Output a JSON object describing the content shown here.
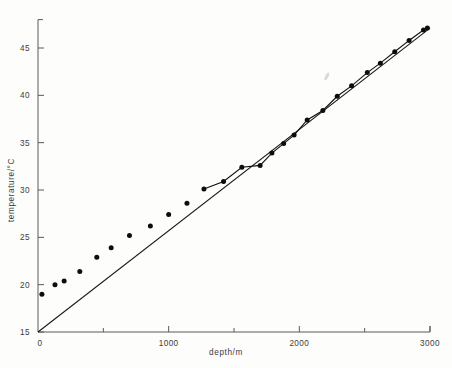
{
  "figure": {
    "name": "temperature-depth-plot",
    "background_color": "#fdfdfc",
    "ink_color": "#111111",
    "axis_color": "#5a5a5a"
  },
  "chart_data": {
    "type": "scatter",
    "title": "",
    "subtitle": "",
    "xlabel": "depth/m",
    "ylabel": "temperature/°C",
    "xlim": [
      0,
      3000
    ],
    "ylim": [
      15,
      48
    ],
    "grid": false,
    "legend_position": "none",
    "xtick_labels": [
      "0",
      "1000",
      "2000",
      "3000"
    ],
    "xtick_values": [
      0,
      1000,
      2000,
      3000
    ],
    "xminor_tick_values": [
      500,
      1500,
      2500
    ],
    "ytick_labels": [
      "15",
      "20",
      "25",
      "30",
      "35",
      "40",
      "45"
    ],
    "ytick_values": [
      15,
      20,
      25,
      30,
      35,
      40,
      45
    ],
    "origin_label": "0",
    "series": [
      {
        "name": "measured temperature",
        "marker": "filled-circle",
        "connected_from_x": 1270,
        "x": [
          30,
          130,
          200,
          320,
          450,
          560,
          700,
          860,
          1000,
          1140,
          1270,
          1420,
          1560,
          1700,
          1790,
          1880,
          1960,
          2060,
          2180,
          2290,
          2400,
          2520,
          2620,
          2730,
          2840,
          2950,
          2980
        ],
        "y": [
          19.0,
          20.0,
          20.4,
          21.4,
          22.9,
          23.9,
          25.2,
          26.2,
          27.4,
          28.6,
          30.1,
          30.9,
          32.4,
          32.6,
          33.9,
          34.9,
          35.8,
          37.4,
          38.4,
          39.9,
          41.0,
          42.4,
          43.4,
          44.6,
          45.8,
          46.9,
          47.1
        ]
      },
      {
        "name": "straight reference line",
        "marker": "none",
        "x": [
          0,
          3000
        ],
        "y": [
          15.0,
          47.1
        ]
      }
    ],
    "annotations": [
      {
        "name": "scan-smudge",
        "x": 2210,
        "y": 42.0,
        "text": ""
      }
    ]
  }
}
